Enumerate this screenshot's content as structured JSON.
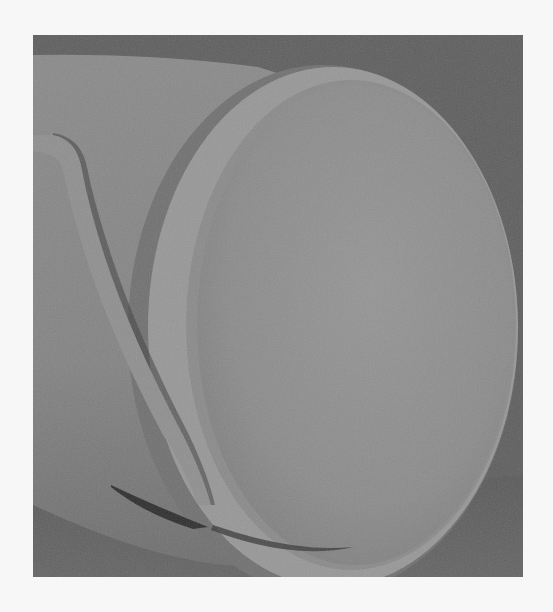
{
  "image": {
    "description": "Grayscale 3D render of a cylindrical body ending in a rounded disc cap with a thin curved strip near the bottom-left",
    "subject": "cylinder-with-disc-cap",
    "palette": {
      "page_background": "#f7f7f7",
      "scene_background": "#5e5e5e",
      "cylinder_body": "#858585",
      "disc_face": "#8e8e8e",
      "disc_rim": "#9a9a9a",
      "rim_shadow": "#6f6f6f",
      "floor": "#5c5c5c",
      "strip": "#8f8f8f",
      "strip_shadow": "#2e2e2e"
    }
  }
}
